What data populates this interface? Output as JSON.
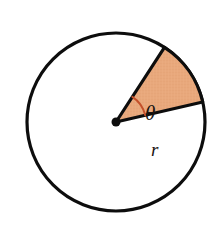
{
  "figure": {
    "background_color": "#ffffff",
    "labels": {
      "angle_symbol": "θ",
      "radius_symbol": "r"
    },
    "colors": {
      "outline": "#0d0d0d",
      "sector_fill": "#E8A87C",
      "sector_edge": "#0d0d0d",
      "angle_arc": "#C4512B",
      "center_dot": "#0d0d0d",
      "label_text": "#1a1410"
    },
    "geometry": {
      "center_x": 116,
      "center_y": 122,
      "radius": 89,
      "outline_stroke_width": 3.2,
      "sector_start_angle_deg": -13,
      "sector_end_angle_deg": -57,
      "sector_sweep_deg": 44,
      "angle_arc_radius": 30,
      "center_dot_radius": 4.5
    },
    "label_positions": {
      "theta_x": 145,
      "theta_y": 120,
      "radius_x": 151,
      "radius_y": 156
    }
  },
  "chart_data": {
    "type": "diagram",
    "subtype": "circle-sector",
    "annotations": [
      {
        "name": "angle",
        "symbol": "θ",
        "description": "central angle of the sector"
      },
      {
        "name": "radius",
        "symbol": "r",
        "description": "radius of the circle"
      }
    ],
    "elements": [
      {
        "name": "circle",
        "shape": "circle",
        "filled": false
      },
      {
        "name": "sector",
        "shape": "circular-sector",
        "filled": true,
        "fill_color": "#E8A87C"
      },
      {
        "name": "center-point",
        "shape": "dot",
        "filled": true
      },
      {
        "name": "angle-arc",
        "shape": "arc",
        "filled": false,
        "color": "#C4512B"
      }
    ]
  }
}
